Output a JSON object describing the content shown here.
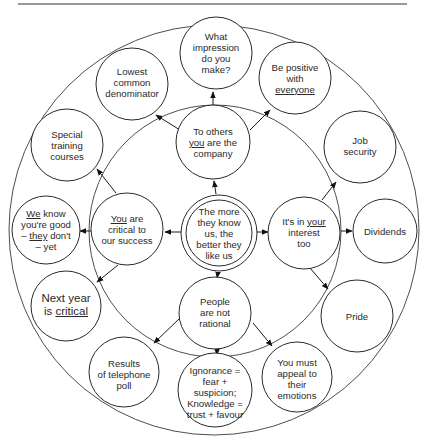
{
  "diagram": {
    "type": "concentric-mind-map",
    "center": {
      "lines": [
        "The more",
        "they know",
        "us, the",
        "better they",
        "like us"
      ]
    },
    "inner_nodes": [
      {
        "id": "to-others",
        "lines": [
          "To others",
          "you are the",
          "company"
        ],
        "underline": "you"
      },
      {
        "id": "its-in-your-interest",
        "lines": [
          "It's in your",
          "interest",
          "too"
        ],
        "underline": "your"
      },
      {
        "id": "people-not-rational",
        "lines": [
          "People",
          "are not",
          "rational"
        ]
      },
      {
        "id": "you-are-critical",
        "lines": [
          "You are",
          "critical to",
          "our success"
        ],
        "underline": "You"
      }
    ],
    "outer_nodes": [
      {
        "id": "what-impression",
        "parent": "to-others",
        "lines": [
          "What",
          "impression",
          "do you",
          "make?"
        ]
      },
      {
        "id": "be-positive",
        "parent": "to-others",
        "lines": [
          "Be positive",
          "with",
          "everyone"
        ],
        "underline": "everyone"
      },
      {
        "id": "lowest-common",
        "parent": "to-others",
        "lines": [
          "Lowest",
          "common",
          "denominator"
        ]
      },
      {
        "id": "job-security",
        "parent": "its-in-your-interest",
        "lines": [
          "Job",
          "security"
        ]
      },
      {
        "id": "dividends",
        "parent": "its-in-your-interest",
        "lines": [
          "Dividends"
        ]
      },
      {
        "id": "pride",
        "parent": "its-in-your-interest",
        "lines": [
          "Pride"
        ]
      },
      {
        "id": "you-must-appeal",
        "parent": "people-not-rational",
        "lines": [
          "You must",
          "appeal to",
          "their",
          "emotions"
        ]
      },
      {
        "id": "ignorance-knowledge",
        "parent": "people-not-rational",
        "lines": [
          "Ignorance =",
          "fear +",
          "suspicion;",
          "Knowledge =",
          "trust + favour"
        ]
      },
      {
        "id": "results-poll",
        "parent": "people-not-rational",
        "lines": [
          "Results",
          "of telephone",
          "poll"
        ]
      },
      {
        "id": "next-year",
        "parent": "you-are-critical",
        "lines": [
          "Next year",
          "is critical"
        ],
        "underline": "critical"
      },
      {
        "id": "we-know",
        "parent": "you-are-critical",
        "lines": [
          "We know",
          "you're good",
          "– they don't",
          "– yet"
        ],
        "underline": [
          "We",
          "they"
        ]
      },
      {
        "id": "special-training",
        "parent": "you-are-critical",
        "lines": [
          "Special",
          "training",
          "courses"
        ]
      }
    ],
    "colors": {
      "stroke": "#2a2a2a",
      "background": "#ffffff"
    }
  }
}
